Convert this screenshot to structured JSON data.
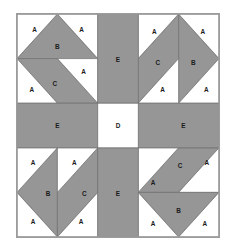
{
  "figure": {
    "width": 236,
    "height": 250
  },
  "colors": {
    "fabric_dark": "#969696",
    "fabric_light": "#ffffff",
    "outline": "#6e6e6e",
    "border": "#9c9c9c",
    "label_text": "#1a1a1a",
    "page_background": "#ffffff"
  },
  "legend": {
    "piece_a": "A",
    "piece_b": "B",
    "piece_c": "C",
    "piece_d": "D",
    "piece_e": "E"
  },
  "labels": {
    "tl": {
      "a1": "A",
      "a2": "A",
      "a3": "A",
      "a4": "A",
      "b": "B",
      "c": "C"
    },
    "tr": {
      "a1": "A",
      "a2": "A",
      "a3": "A",
      "a4": "A",
      "b": "B",
      "c": "C"
    },
    "bl": {
      "a1": "A",
      "a2": "A",
      "a3": "A",
      "a4": "A",
      "b": "B",
      "c": "C"
    },
    "br": {
      "a1": "A",
      "a2": "A",
      "a3": "A",
      "a4": "A",
      "b": "B",
      "c": "C"
    },
    "center": {
      "d": "D"
    },
    "sashing": {
      "top": "E",
      "left": "E",
      "right": "E",
      "bottom": "E"
    }
  }
}
